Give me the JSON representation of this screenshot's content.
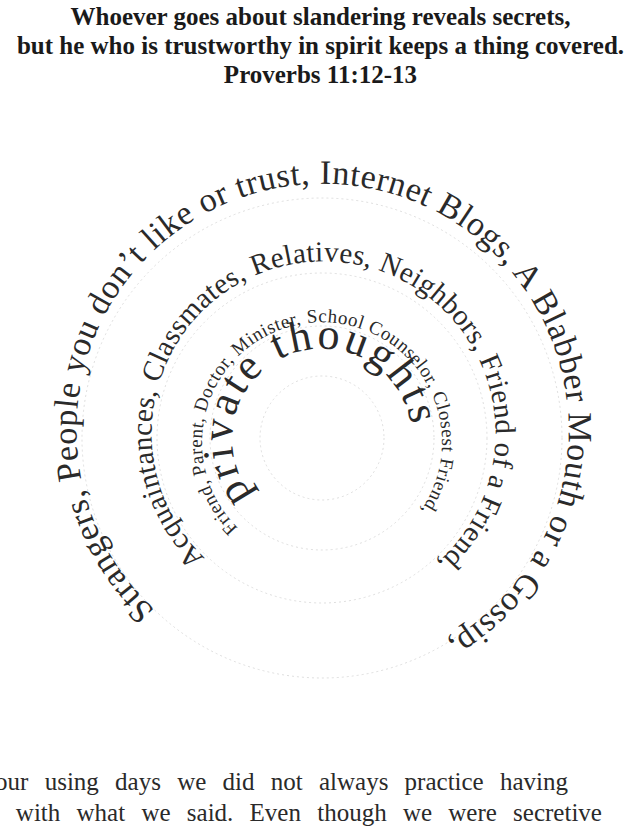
{
  "header": {
    "line1": "Whoever goes about slandering reveals secrets,",
    "line2": "but he who is trustworthy in spirit keeps a thing covered.",
    "reference": "Proverbs 11:12-13"
  },
  "spiral": {
    "center_text": "private thoughts",
    "ring2": "Friend, Parent, Doctor, Minister, School Counselor, Closest Friend,",
    "ring3": "Acquaintances, Classmates, Relatives, Neighbors, Friend of a Friend,",
    "ring4": "Strangers, People you don’t like or trust, Internet Blogs, A Blabber Mouth or a Gossip,"
  },
  "body": {
    "line1": "In our using days we did not always practice having",
    "line2": "care with what we said. Even though we were secretive"
  }
}
